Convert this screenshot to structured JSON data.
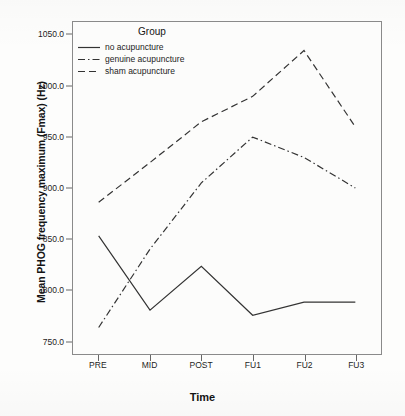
{
  "chart_data": {
    "type": "line",
    "title": "",
    "xlabel": "Time",
    "ylabel": "Mean PHOG frequency maximum (Fmax) (Hz)",
    "categories": [
      "PRE",
      "MID",
      "POST",
      "FU1",
      "FU2",
      "FU3"
    ],
    "ylim": [
      737,
      1063
    ],
    "yticks": [
      750.0,
      800.0,
      850.0,
      900.0,
      950.0,
      1000.0,
      1050.0
    ],
    "ytick_labels": [
      "750.0",
      "800.0",
      "850.0",
      "900.0",
      "950.0",
      "1000.0",
      "1050.0"
    ],
    "grid": false,
    "legend_position": "top-left-inside",
    "legend_title": "Group",
    "series": [
      {
        "name": "no acupuncture",
        "linestyle": "solid",
        "color": "#333333",
        "values": [
          853,
          780,
          823,
          775,
          788,
          788
        ]
      },
      {
        "name": "genuine acupuncture",
        "linestyle": "dashdot",
        "color": "#333333",
        "values": [
          763,
          840,
          905,
          950,
          930,
          900
        ]
      },
      {
        "name": "sham acupuncture",
        "linestyle": "dashed",
        "color": "#333333",
        "values": [
          886,
          925,
          965,
          990,
          1035,
          960
        ]
      }
    ]
  }
}
